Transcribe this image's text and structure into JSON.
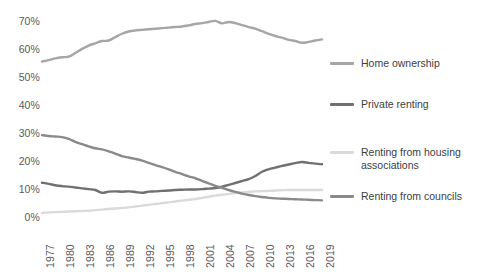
{
  "chart_data": {
    "type": "line",
    "title": "",
    "xlabel": "",
    "ylabel": "",
    "grid": false,
    "legend_position": "right",
    "xlim": [
      1977,
      2019
    ],
    "ylim": [
      0,
      70
    ],
    "y_ticks": [
      0,
      10,
      20,
      30,
      40,
      50,
      60,
      70
    ],
    "y_tick_labels": [
      "0%",
      "10%",
      "20%",
      "30%",
      "40%",
      "50%",
      "60%",
      "70%"
    ],
    "x_tick_labels": [
      "1977",
      "1980",
      "1983",
      "1986",
      "1989",
      "1992",
      "1995",
      "1998",
      "2001",
      "2004",
      "2007",
      "2010",
      "2013",
      "2016",
      "2019"
    ],
    "x": [
      1977,
      1978,
      1979,
      1980,
      1981,
      1982,
      1983,
      1984,
      1985,
      1986,
      1987,
      1988,
      1989,
      1990,
      1991,
      1992,
      1993,
      1994,
      1995,
      1996,
      1997,
      1998,
      1999,
      2000,
      2001,
      2002,
      2003,
      2004,
      2005,
      2006,
      2007,
      2008,
      2009,
      2010,
      2011,
      2012,
      2013,
      2014,
      2015,
      2016,
      2017,
      2018,
      2019
    ],
    "series": [
      {
        "name": "Home ownership",
        "color": "#a6a6a6",
        "values": [
          55.9,
          56.4,
          57.0,
          57.4,
          57.6,
          58.9,
          60.4,
          61.6,
          62.4,
          63.2,
          63.4,
          64.6,
          65.8,
          66.6,
          67.0,
          67.2,
          67.4,
          67.6,
          67.8,
          68.0,
          68.2,
          68.4,
          68.8,
          69.3,
          69.6,
          70.0,
          70.4,
          69.5,
          70.0,
          69.6,
          68.9,
          68.2,
          67.6,
          66.7,
          65.8,
          65.0,
          64.4,
          63.6,
          63.2,
          62.6,
          62.9,
          63.4,
          63.8
        ]
      },
      {
        "name": "Private renting",
        "color": "#707070",
        "values": [
          12.6,
          12.2,
          11.7,
          11.4,
          11.2,
          10.9,
          10.6,
          10.3,
          10.0,
          9.0,
          9.4,
          9.5,
          9.4,
          9.5,
          9.3,
          9.0,
          9.4,
          9.5,
          9.7,
          9.8,
          10.0,
          10.1,
          10.2,
          10.2,
          10.3,
          10.5,
          10.7,
          11.2,
          11.8,
          12.5,
          13.2,
          13.9,
          15.0,
          16.5,
          17.4,
          18.0,
          18.6,
          19.1,
          19.6,
          20.0,
          19.7,
          19.4,
          19.2
        ]
      },
      {
        "name": "Renting from housing associations",
        "color": "#dadada",
        "values": [
          1.8,
          2.0,
          2.1,
          2.2,
          2.3,
          2.4,
          2.5,
          2.6,
          2.8,
          3.0,
          3.2,
          3.4,
          3.6,
          3.8,
          4.1,
          4.4,
          4.7,
          5.0,
          5.3,
          5.6,
          5.9,
          6.2,
          6.5,
          6.8,
          7.2,
          7.6,
          8.0,
          8.3,
          8.6,
          8.9,
          9.1,
          9.3,
          9.5,
          9.6,
          9.7,
          9.8,
          9.9,
          10.0,
          10.0,
          10.0,
          10.0,
          10.0,
          10.0
        ]
      },
      {
        "name": "Renting from councils",
        "color": "#8a8a8a",
        "values": [
          29.6,
          29.3,
          29.1,
          28.9,
          28.3,
          27.2,
          26.4,
          25.6,
          24.9,
          24.5,
          23.8,
          23.0,
          22.1,
          21.6,
          21.1,
          20.5,
          19.7,
          18.9,
          18.2,
          17.4,
          16.5,
          15.7,
          14.9,
          14.2,
          13.3,
          12.4,
          11.5,
          10.8,
          10.0,
          9.3,
          8.7,
          8.2,
          7.8,
          7.5,
          7.2,
          7.0,
          6.9,
          6.8,
          6.7,
          6.6,
          6.5,
          6.4,
          6.3
        ]
      }
    ]
  },
  "legend": {
    "items": [
      {
        "label": "Home ownership",
        "color": "#a6a6a6"
      },
      {
        "label": "Private renting",
        "color": "#707070"
      },
      {
        "label": "Renting from housing associations",
        "color": "#dadada"
      },
      {
        "label": "Renting from councils",
        "color": "#8a8a8a"
      }
    ]
  },
  "colors": {
    "background": "#ffffff",
    "axis_text": "#5a5a5a",
    "legend_text": "#404040"
  }
}
